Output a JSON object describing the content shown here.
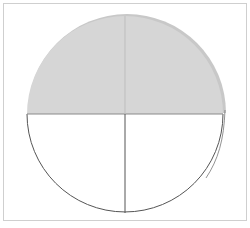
{
  "diagram": {
    "type": "fraction-circle",
    "total_parts": 4,
    "shaded_parts": 2,
    "colors": {
      "shade": "#d4d4d4",
      "shade_edge": "#c4c4c4",
      "line": "#555555",
      "frame": "#cfcfcf",
      "background": "#ffffff"
    }
  }
}
